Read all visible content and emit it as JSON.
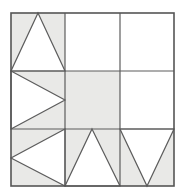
{
  "figure": {
    "canvas": {
      "width": 185,
      "height": 194
    },
    "colors": {
      "background": "#ffffff",
      "shade": "#e9e9e7",
      "stroke": "#5d5d5d",
      "outer_stroke": "#555555"
    },
    "grid": {
      "rows": 3,
      "cols": 3,
      "x_lines": [
        11,
        65,
        120,
        174
      ],
      "y_lines": [
        13,
        71,
        129,
        186
      ],
      "outer_stroke_width": 1.6,
      "inner_stroke_width": 1.2
    },
    "cells": [
      {
        "id": "cell-r1c1",
        "row": 1,
        "col": 1,
        "fill": "shaded",
        "figure": "white-triangle-up",
        "description": "shaded square with white upward triangle, apex at top centre, base along bottom edge",
        "shaded_shape_points": "11,13 65,13 65,71 11,71",
        "white_shape_points": "38,13 65,71 11,71"
      },
      {
        "id": "cell-r1c2",
        "row": 1,
        "col": 2,
        "fill": "white",
        "figure": "empty",
        "description": "plain white square",
        "shaded_shape_points": "",
        "white_shape_points": ""
      },
      {
        "id": "cell-r1c3",
        "row": 1,
        "col": 3,
        "fill": "white",
        "figure": "empty",
        "description": "plain white square",
        "shaded_shape_points": "",
        "white_shape_points": ""
      },
      {
        "id": "cell-r2c1",
        "row": 2,
        "col": 1,
        "fill": "shaded",
        "figure": "white-triangle-right",
        "description": "shaded square with white triangle pointing right, apex at right centre, base along left edge",
        "shaded_shape_points": "11,71 65,71 65,129 11,129",
        "white_shape_points": "11,71 65,100 11,129"
      },
      {
        "id": "cell-r2c2",
        "row": 2,
        "col": 2,
        "fill": "shaded",
        "figure": "solid-shaded",
        "description": "fully shaded square",
        "shaded_shape_points": "65,71 120,71 120,129 65,129",
        "white_shape_points": ""
      },
      {
        "id": "cell-r2c3",
        "row": 2,
        "col": 3,
        "fill": "white",
        "figure": "empty",
        "description": "plain white square",
        "shaded_shape_points": "",
        "white_shape_points": ""
      },
      {
        "id": "cell-r3c1",
        "row": 3,
        "col": 1,
        "fill": "shaded",
        "figure": "white-triangle-left",
        "description": "shaded square with white triangle pointing left, apex at left centre, base along right edge",
        "shaded_shape_points": "11,129 65,129 65,186 11,186",
        "white_shape_points": "65,129 65,186 11,158"
      },
      {
        "id": "cell-r3c2",
        "row": 3,
        "col": 2,
        "fill": "shaded",
        "figure": "white-triangle-up",
        "description": "shaded square with white upward triangle, apex at top centre, base along bottom edge",
        "shaded_shape_points": "65,129 120,129 120,186 65,186",
        "white_shape_points": "92,129 120,186 65,186"
      },
      {
        "id": "cell-r3c3",
        "row": 3,
        "col": 3,
        "fill": "shaded",
        "figure": "white-triangle-down",
        "description": "shaded square with white downward triangle, base along top edge, apex at bottom centre",
        "shaded_shape_points": "120,129 174,129 174,186 120,186",
        "white_shape_points": "120,129 174,129 147,186"
      }
    ]
  }
}
